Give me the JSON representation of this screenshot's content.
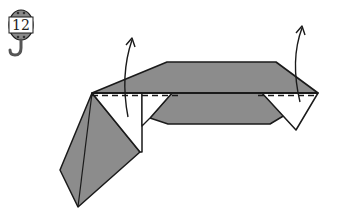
{
  "step": {
    "number": "12",
    "icon": "hook-tag-icon"
  },
  "diagram": {
    "type": "origami-fold-step",
    "colors": {
      "paper_colored": "#8c8c8c",
      "paper_white": "#ffffff",
      "line": "#1a1a1a",
      "tag_band": "#8a8a8a"
    },
    "fold_lines": [
      {
        "kind": "valley-dashed",
        "from": [
          92,
          93
        ],
        "to": [
          318,
          93
        ]
      }
    ],
    "arrows": [
      {
        "name": "fold-up-arrow-left",
        "direction": "up"
      },
      {
        "name": "fold-up-arrow-right",
        "direction": "up"
      }
    ]
  }
}
